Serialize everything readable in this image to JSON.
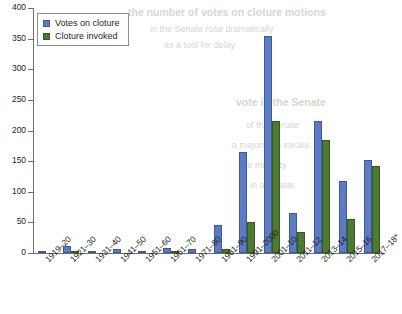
{
  "chart_data": {
    "type": "bar",
    "title": "",
    "xlabel": "",
    "ylabel": "",
    "ylim": [
      0,
      400
    ],
    "ytick_step": 50,
    "yticks": [
      400,
      350,
      300,
      250,
      200,
      150,
      100,
      50,
      0
    ],
    "grid": false,
    "legend_position": "top-left",
    "categories": [
      "1919–20",
      "1921–30",
      "1931–40",
      "1941–50",
      "1951–60",
      "1961–70",
      "1971–80",
      "1981–90",
      "1991–2000",
      "2001–10",
      "2011–12",
      "2013–14",
      "2015–16",
      "2017–18*"
    ],
    "series": [
      {
        "name": "Votes on cloture",
        "color": "#5b7cc4",
        "values": [
          1,
          12,
          3,
          7,
          2,
          9,
          6,
          46,
          165,
          355,
          65,
          215,
          117,
          152
        ]
      },
      {
        "name": "Cloture invoked",
        "color": "#4c7a2e",
        "values": [
          0,
          2,
          0,
          0,
          0,
          1,
          0,
          7,
          50,
          215,
          35,
          185,
          55,
          142
        ]
      }
    ]
  },
  "legend": {
    "items": [
      {
        "label": "Votes on cloture",
        "swatch": "blue-square-swatch"
      },
      {
        "label": "Cloture invoked",
        "swatch": "green-square-swatch"
      }
    ]
  },
  "bleed_text": {
    "lines": [
      "the number of votes on cloture motions",
      "in the Senate rose dramatically",
      "as a tool for delay",
      "vote in the Senate",
      "of the Senate",
      "a majority to invoke",
      "the minority",
      "in a debate"
    ]
  }
}
